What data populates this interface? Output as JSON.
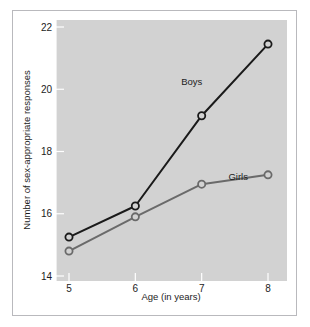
{
  "figure": {
    "background_color": "#ffffff",
    "frame_border_color": "#b9b9bd",
    "plot_background_color": "#d2d2d2"
  },
  "chart_data": {
    "type": "line",
    "title": "",
    "xlabel": "Age (in years)",
    "ylabel": "Number of sex-appropriate responses",
    "x": [
      5,
      6,
      7,
      8
    ],
    "xticklabels": [
      "5",
      "6",
      "7",
      "8"
    ],
    "yticks": [
      14,
      16,
      18,
      20,
      22
    ],
    "yticklabels": [
      "14",
      "16",
      "18",
      "20",
      "22"
    ],
    "xlim": [
      4.6,
      8.3
    ],
    "ylim": [
      14,
      22
    ],
    "grid": false,
    "legend_position": "inline-annotation",
    "series": [
      {
        "name": "Boys",
        "label": "Boys",
        "color": "#1a1a1a",
        "marker": "open-circle",
        "values": [
          15.25,
          16.25,
          19.15,
          21.45
        ]
      },
      {
        "name": "Girls",
        "label": "Girls",
        "color": "#6a6a6a",
        "marker": "open-circle",
        "values": [
          14.8,
          15.9,
          16.95,
          17.25
        ]
      }
    ],
    "annotations": [
      {
        "text": "Boys",
        "x": 6.85,
        "y": 20.15
      },
      {
        "text": "Girls",
        "x": 7.55,
        "y": 17.1
      }
    ]
  }
}
